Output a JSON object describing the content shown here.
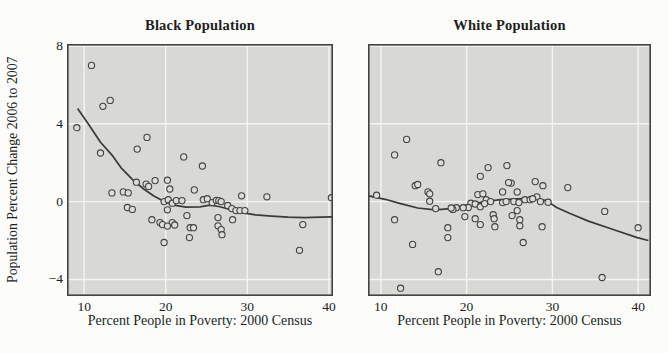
{
  "style": {
    "page_bg": "#fcfcfa",
    "panel_bg": "#d8d8d5",
    "grid_color": "#f4f4f1",
    "border_color": "#454240",
    "point_fill": "#dcdcd8",
    "point_stroke": "#424240",
    "line_color": "#3a3a38",
    "text_color": "#201f1d"
  },
  "chart_data": [
    {
      "type": "scatter",
      "title": "Black Population",
      "xlabel": "Percent People in Poverty: 2000 Census",
      "ylabel": "Population Percent Change 2006 to 2007",
      "xlim": [
        7.9,
        40.5
      ],
      "ylim": [
        -4.85,
        8.1
      ],
      "xticks": [
        10,
        20,
        30,
        40
      ],
      "yticks": [
        8,
        4,
        0,
        -4
      ],
      "ytick_labels": [
        "8",
        "4",
        "0",
        "−4"
      ],
      "grid": true,
      "legend": "none",
      "points": [
        [
          10.9,
          7.0
        ],
        [
          12.3,
          4.9
        ],
        [
          13.2,
          5.2
        ],
        [
          9.1,
          3.8
        ],
        [
          12.0,
          2.5
        ],
        [
          16.5,
          2.7
        ],
        [
          17.7,
          3.3
        ],
        [
          22.2,
          2.3
        ],
        [
          24.5,
          1.83
        ],
        [
          13.4,
          0.45
        ],
        [
          14.8,
          0.5
        ],
        [
          15.4,
          0.45
        ],
        [
          16.4,
          1.0
        ],
        [
          17.6,
          0.9
        ],
        [
          17.9,
          0.78
        ],
        [
          18.7,
          1.08
        ],
        [
          20.2,
          1.1
        ],
        [
          20.5,
          0.65
        ],
        [
          15.3,
          -0.3
        ],
        [
          15.9,
          -0.4
        ],
        [
          18.3,
          -0.93
        ],
        [
          19.3,
          -1.08
        ],
        [
          19.8,
          0.0
        ],
        [
          20.3,
          0.1
        ],
        [
          20.8,
          -0.08
        ],
        [
          21.3,
          0.05
        ],
        [
          22.0,
          0.05
        ],
        [
          20.2,
          -0.42
        ],
        [
          20.8,
          -1.08
        ],
        [
          21.1,
          -1.2
        ],
        [
          19.6,
          -1.18
        ],
        [
          20.2,
          -1.26
        ],
        [
          22.6,
          -0.72
        ],
        [
          23.0,
          -1.34
        ],
        [
          23.4,
          -1.34
        ],
        [
          22.9,
          -1.85
        ],
        [
          19.8,
          -2.1
        ],
        [
          23.5,
          0.6
        ],
        [
          24.6,
          0.1
        ],
        [
          25.1,
          0.15
        ],
        [
          25.7,
          -0.05
        ],
        [
          26.2,
          0.07
        ],
        [
          26.5,
          0.05
        ],
        [
          26.8,
          0.0
        ],
        [
          27.6,
          -0.2
        ],
        [
          28.1,
          -0.36
        ],
        [
          28.6,
          -0.46
        ],
        [
          29.1,
          -0.46
        ],
        [
          29.7,
          -0.46
        ],
        [
          26.4,
          -0.82
        ],
        [
          28.2,
          -0.93
        ],
        [
          26.4,
          -1.24
        ],
        [
          26.8,
          -1.44
        ],
        [
          26.9,
          -1.7
        ],
        [
          29.3,
          0.3
        ],
        [
          32.4,
          0.25
        ],
        [
          36.8,
          -1.18
        ],
        [
          36.4,
          -2.5
        ],
        [
          40.3,
          0.2
        ]
      ],
      "smooth_line": [
        [
          9.2,
          4.78
        ],
        [
          10.5,
          4.0
        ],
        [
          12.0,
          3.05
        ],
        [
          13.5,
          2.35
        ],
        [
          14.5,
          1.75
        ],
        [
          16.0,
          1.1
        ],
        [
          17.3,
          0.65
        ],
        [
          18.5,
          0.3
        ],
        [
          19.8,
          0.0
        ],
        [
          21.0,
          -0.18
        ],
        [
          22.5,
          -0.28
        ],
        [
          24.2,
          -0.27
        ],
        [
          25.4,
          -0.18
        ],
        [
          26.5,
          -0.25
        ],
        [
          28.0,
          -0.42
        ],
        [
          29.5,
          -0.58
        ],
        [
          31.0,
          -0.68
        ],
        [
          33.0,
          -0.75
        ],
        [
          35.0,
          -0.8
        ],
        [
          37.0,
          -0.82
        ],
        [
          39.0,
          -0.8
        ],
        [
          40.4,
          -0.78
        ]
      ]
    },
    {
      "type": "scatter",
      "title": "White Population",
      "xlabel": "Percent People in Poverty: 2000 Census",
      "ylabel": "Population Percent Change 2006 to 2007",
      "xlim": [
        8.5,
        41.5
      ],
      "ylim": [
        -4.85,
        8.1
      ],
      "xticks": [
        10,
        20,
        30,
        40
      ],
      "yticks": [
        8,
        4,
        0,
        -4
      ],
      "ytick_labels": [],
      "grid": true,
      "legend": "none",
      "points": [
        [
          13.0,
          3.2
        ],
        [
          11.6,
          2.4
        ],
        [
          17.0,
          2.0
        ],
        [
          14.0,
          0.82
        ],
        [
          14.3,
          0.88
        ],
        [
          15.5,
          0.5
        ],
        [
          15.7,
          0.4
        ],
        [
          15.7,
          0.02
        ],
        [
          21.6,
          1.3
        ],
        [
          22.5,
          1.75
        ],
        [
          24.7,
          1.85
        ],
        [
          25.2,
          0.95
        ],
        [
          24.2,
          0.5
        ],
        [
          21.3,
          0.36
        ],
        [
          21.9,
          0.4
        ],
        [
          22.3,
          0.1
        ],
        [
          20.5,
          -0.08
        ],
        [
          21.0,
          -0.12
        ],
        [
          21.6,
          -0.26
        ],
        [
          22.1,
          -0.1
        ],
        [
          22.8,
          0.0
        ],
        [
          20.2,
          -0.3
        ],
        [
          19.6,
          -0.31
        ],
        [
          18.8,
          -0.31
        ],
        [
          18.4,
          -0.4
        ],
        [
          9.5,
          0.33
        ],
        [
          11.6,
          -0.93
        ],
        [
          13.7,
          -2.2
        ],
        [
          17.8,
          -1.34
        ],
        [
          17.8,
          -1.85
        ],
        [
          16.4,
          -0.36
        ],
        [
          18.2,
          -0.33
        ],
        [
          19.8,
          -0.77
        ],
        [
          21.0,
          -0.88
        ],
        [
          21.6,
          -1.18
        ],
        [
          23.1,
          -0.67
        ],
        [
          23.2,
          -0.88
        ],
        [
          23.3,
          -1.29
        ],
        [
          24.2,
          -0.05
        ],
        [
          24.6,
          0.0
        ],
        [
          16.7,
          -3.6
        ],
        [
          12.3,
          -4.45
        ],
        [
          24.9,
          0.98
        ],
        [
          28.0,
          1.03
        ],
        [
          28.9,
          0.82
        ],
        [
          31.8,
          0.72
        ],
        [
          25.9,
          0.5
        ],
        [
          25.5,
          0.0
        ],
        [
          26.1,
          -0.05
        ],
        [
          26.8,
          0.1
        ],
        [
          27.4,
          0.1
        ],
        [
          28.2,
          0.25
        ],
        [
          28.6,
          0.0
        ],
        [
          27.7,
          0.15
        ],
        [
          29.5,
          -0.03
        ],
        [
          25.9,
          -0.46
        ],
        [
          25.3,
          -0.72
        ],
        [
          26.2,
          -0.93
        ],
        [
          26.2,
          -1.24
        ],
        [
          28.8,
          -1.29
        ],
        [
          26.6,
          -2.1
        ],
        [
          36.1,
          -0.5
        ],
        [
          40.0,
          -1.34
        ],
        [
          35.8,
          -3.9
        ]
      ],
      "smooth_line": [
        [
          8.6,
          0.3
        ],
        [
          10.5,
          0.12
        ],
        [
          12.3,
          -0.1
        ],
        [
          14.3,
          -0.33
        ],
        [
          16.3,
          -0.42
        ],
        [
          18.2,
          -0.36
        ],
        [
          20.2,
          -0.15
        ],
        [
          22.1,
          0.0
        ],
        [
          24.0,
          0.1
        ],
        [
          26.0,
          0.14
        ],
        [
          27.7,
          0.18
        ],
        [
          29.3,
          0.05
        ],
        [
          30.5,
          -0.3
        ],
        [
          32.0,
          -0.6
        ],
        [
          34.2,
          -1.0
        ],
        [
          37.0,
          -1.42
        ],
        [
          39.9,
          -1.85
        ],
        [
          41.2,
          -2.0
        ]
      ]
    }
  ]
}
